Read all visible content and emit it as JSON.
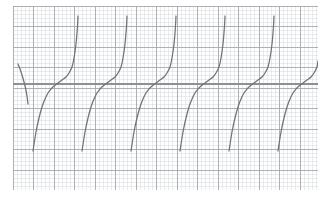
{
  "page": {
    "width": 328,
    "height": 202,
    "background_color": "#ffffff"
  },
  "plot_area": {
    "left": 13,
    "top": 6,
    "width": 305,
    "height": 184,
    "background_color": "#ffffff"
  },
  "grid": {
    "minor_spacing_px": 4.1,
    "major_every": 5,
    "minor_color": "#d8dade",
    "major_color": "#a6a9ad",
    "minor_width": 0.55,
    "major_width": 0.9,
    "show_minor": true,
    "show_major": true
  },
  "axes": {
    "x_axis_y_px": 78,
    "x_axis_color": "#8d9095",
    "x_axis_width": 1.1,
    "show_x_axis": true,
    "show_y_axis": false
  },
  "curve": {
    "color": "#6f7377",
    "width": 1.25,
    "linecap": "round",
    "style": "solid"
  },
  "chart_data": {
    "type": "line",
    "title": "Tangent-type periodic function on graph paper",
    "subtitle": "",
    "xlabel": "",
    "ylabel": "",
    "grid": true,
    "legend_position": "none",
    "tick_labels_x": [],
    "tick_labels_y": [],
    "xlim": [
      0,
      305
    ],
    "ylim": [
      184,
      0
    ],
    "asymptotes_px": [
      16,
      65,
      114,
      163,
      212,
      261,
      310
    ],
    "period_px": 49,
    "x_axis_y_px": 78,
    "branch_top_px": 10,
    "branch_bottom_px": 150,
    "series": [
      {
        "name": "branch-1",
        "points": [
          [
            5,
            58
          ],
          [
            7,
            63
          ],
          [
            9,
            69
          ],
          [
            11,
            76
          ],
          [
            12.5,
            82
          ],
          [
            14,
            90
          ],
          [
            15,
            98
          ]
        ]
      },
      {
        "name": "branch-2",
        "points": [
          [
            20,
            145
          ],
          [
            23,
            126
          ],
          [
            26,
            112
          ],
          [
            29,
            101
          ],
          [
            32,
            93
          ],
          [
            35,
            87
          ],
          [
            38,
            83
          ],
          [
            41,
            80
          ],
          [
            45,
            77
          ],
          [
            49,
            74
          ],
          [
            53,
            71
          ],
          [
            56,
            67
          ],
          [
            59,
            61
          ],
          [
            61,
            52
          ],
          [
            63,
            38
          ],
          [
            64.5,
            20
          ],
          [
            65,
            10
          ]
        ]
      },
      {
        "name": "branch-3",
        "points": [
          [
            69,
            145
          ],
          [
            72,
            126
          ],
          [
            75,
            112
          ],
          [
            78,
            101
          ],
          [
            81,
            93
          ],
          [
            84,
            87
          ],
          [
            87,
            83
          ],
          [
            90,
            80
          ],
          [
            94,
            77
          ],
          [
            98,
            74
          ],
          [
            102,
            71
          ],
          [
            105,
            67
          ],
          [
            108,
            61
          ],
          [
            110,
            52
          ],
          [
            112,
            38
          ],
          [
            113.5,
            20
          ],
          [
            114,
            10
          ]
        ]
      },
      {
        "name": "branch-4",
        "points": [
          [
            118,
            145
          ],
          [
            121,
            126
          ],
          [
            124,
            112
          ],
          [
            127,
            101
          ],
          [
            130,
            93
          ],
          [
            133,
            87
          ],
          [
            136,
            83
          ],
          [
            139,
            80
          ],
          [
            143,
            77
          ],
          [
            147,
            74
          ],
          [
            151,
            71
          ],
          [
            154,
            67
          ],
          [
            157,
            61
          ],
          [
            159,
            52
          ],
          [
            161,
            38
          ],
          [
            162.5,
            20
          ],
          [
            163,
            10
          ]
        ]
      },
      {
        "name": "branch-5",
        "points": [
          [
            167,
            145
          ],
          [
            170,
            126
          ],
          [
            173,
            112
          ],
          [
            176,
            101
          ],
          [
            179,
            93
          ],
          [
            182,
            87
          ],
          [
            185,
            83
          ],
          [
            188,
            80
          ],
          [
            192,
            77
          ],
          [
            196,
            74
          ],
          [
            200,
            71
          ],
          [
            203,
            67
          ],
          [
            206,
            61
          ],
          [
            208,
            52
          ],
          [
            210,
            38
          ],
          [
            211.5,
            20
          ],
          [
            212,
            10
          ]
        ]
      },
      {
        "name": "branch-6",
        "points": [
          [
            216,
            145
          ],
          [
            219,
            126
          ],
          [
            222,
            112
          ],
          [
            225,
            101
          ],
          [
            228,
            93
          ],
          [
            231,
            87
          ],
          [
            234,
            83
          ],
          [
            237,
            80
          ],
          [
            241,
            77
          ],
          [
            245,
            74
          ],
          [
            249,
            71
          ],
          [
            252,
            67
          ],
          [
            255,
            61
          ],
          [
            257,
            52
          ],
          [
            259,
            38
          ],
          [
            260.5,
            20
          ],
          [
            261,
            10
          ]
        ]
      },
      {
        "name": "branch-7",
        "points": [
          [
            265,
            145
          ],
          [
            268,
            126
          ],
          [
            271,
            112
          ],
          [
            274,
            101
          ],
          [
            277,
            93
          ],
          [
            280,
            87
          ],
          [
            283,
            83
          ],
          [
            286,
            80
          ],
          [
            290,
            77
          ],
          [
            294,
            74
          ],
          [
            298,
            71
          ],
          [
            301,
            67
          ],
          [
            304,
            61
          ],
          [
            305,
            55
          ]
        ]
      }
    ]
  }
}
